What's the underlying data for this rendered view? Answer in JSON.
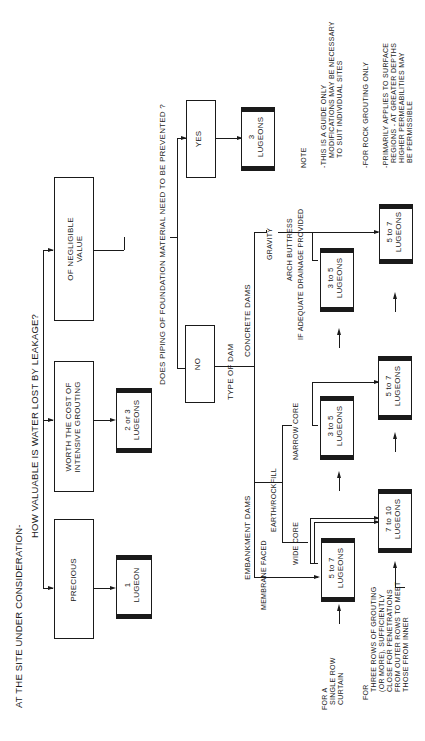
{
  "title": "AT THE SITE UNDER CONSIDERATION-",
  "question1": "HOW VALUABLE IS WATER LOST BY LEAKAGE?",
  "value_options": [
    {
      "label": "PRECIOUS",
      "result": [
        "1",
        "LUGEON"
      ]
    },
    {
      "label_lines": [
        "WORTH THE COST OF",
        "INTENSIVE GROUTING"
      ],
      "result": [
        "2 or 3",
        "LUGEONS"
      ]
    },
    {
      "label_lines": [
        "OF NEGLIGIBLE",
        "VALUE"
      ]
    }
  ],
  "question2": "DOES PIPING OF FOUNDATION MATERIAL NEED TO BE PREVENTED ?",
  "piping_options": {
    "yes": {
      "label": "YES",
      "result": [
        "3",
        "LUGEONS"
      ]
    },
    "no": {
      "label": "NO"
    }
  },
  "type_of_dam": "TYPE OF DAM",
  "embankment": {
    "label": "EMBANKMENT DAMS",
    "membrane_faced": "MEMBRANE FACED",
    "earth_rockfill": "EARTH/ROCKFILL",
    "wide_core": "WIDE CORE",
    "narrow_core": "NARROW CORE",
    "single_results": [
      [
        "5 to 7",
        "LUGEONS"
      ],
      [
        "3 to 5",
        "LUGEONS"
      ]
    ],
    "multi_results": [
      [
        "7 to 10",
        "LUGEONS"
      ],
      [
        "5 to 7",
        "LUGEONS"
      ]
    ]
  },
  "concrete": {
    "label": "CONCRETE DAMS",
    "gravity": "GRAVITY",
    "arch_buttress": "ARCH BUTTRESS",
    "drainage_note": "IF ADEQUATE DRAINAGE PROVIDED",
    "single_result": [
      "3 to 5",
      "LUGEONS"
    ],
    "multi_result": [
      "5 to 7",
      "LUGEONS"
    ]
  },
  "row_labels": {
    "single": [
      "FOR A",
      "SINGLE ROW",
      "CURTAIN"
    ],
    "multi": [
      "FOR",
      "THREE ROWS OF GROUTING",
      "(OR MORE), SUFFICIENTLY",
      "CLOSE FOR PENETRATIONS",
      "FROM OUTER ROWS TO MEET",
      "THOSE FROM INNER"
    ]
  },
  "notes": {
    "heading": "NOTE",
    "items": [
      [
        "-THIS IS A GUIDE ONLY",
        "MODIFICATIONS MAY BE NECESSARY",
        "TO SUIT INDIVIDUAL SITES"
      ],
      [
        "-FOR ROCK GROUTING ONLY"
      ],
      [
        "-PRIMARILY APPLIES TO SURFACE",
        "REGIONS - AT GREATER DEPTHS",
        "HIGHER PERMEABILITIES MAY",
        "BE PERMISSIBLE"
      ]
    ]
  }
}
